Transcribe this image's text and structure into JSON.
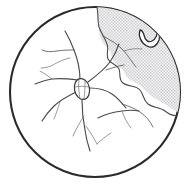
{
  "figure": {
    "title": "Retinal detachment fundus diagram",
    "caption": "",
    "background_color": "#ffffff"
  },
  "globe": {
    "label": "fundus-circle",
    "center_x": 95,
    "center_y": 92,
    "radius": 86,
    "fill_color": "#ffffff",
    "stroke_color": "#2b2b2e",
    "stroke_width": 2.1
  },
  "detachment": {
    "label": "detached-retina-region",
    "description": "Superotemporal bullous detachment",
    "fill_color": "#d6d6d8",
    "pattern": "stipple-dots",
    "pattern_dot_color": "#cfcfd2",
    "pattern_background": "#f2f2f3",
    "edge_color": "#4a4a4f",
    "path": "M 96 6 C 100 26 96 38 106 46 C 114 53 110 62 118 66 C 126 70 124 78 134 82 C 144 86 146 94 156 99 C 166 104 172 110 178 112 C 172 70 150 30 114 11 Z"
  },
  "optic_disc": {
    "label": "optic-disc",
    "center_x": 82,
    "center_y": 89,
    "radius_x": 7.5,
    "radius_y": 10.5,
    "rotation_deg": -12,
    "fill_color": "#ffffff",
    "stroke_color": "#3a3a3e"
  },
  "tear": {
    "label": "horseshoe-retinal-tear",
    "description": "U-shaped flap tear at superotemporal periphery",
    "center_x": 148,
    "center_y": 40,
    "fill_color": "#ffffff",
    "stroke_color": "#2f2f33",
    "path": "M 140 31 C 139 36 141 42 146 45 C 151 48 156 45 158 40 C 159 36 158 33 156 31 C 157 35 156 39 152 41 C 148 43 145 40 144 36 C 143 33 142 31 140 31 Z"
  },
  "vessels": {
    "label": "retinal-vessel-tree",
    "stroke_color": "#4a4a4f",
    "branch_count": 14,
    "paths": [
      "M 80 80 C 80 70 78 60 74 50 C 71 42 68 36 65 31",
      "M 74 50 C 69 50 63 50 57 51 C 51 52 46 52 42 50",
      "M 70 58 C 64 59 58 62 53 65 C 49 67 45 68 41 68",
      "M 78 80 C 70 79 60 78 52 79 C 45 80 40 82 35 84",
      "M 76 92 C 68 96 60 100 54 106 C 49 111 45 116 42 121",
      "M 60 102 C 58 108 56 114 54 119",
      "M 82 100 C 82 110 83 120 85 130 C 86 138 88 145 90 150",
      "M 84 116 C 80 122 76 129 73 135",
      "M 86 126 C 90 132 94 138 98 143",
      "M 88 82 C 96 76 104 70 110 62 C 114 56 117 50 119 44",
      "M 106 70 C 112 68 118 66 124 65",
      "M 90 88 C 98 88 106 90 112 94 C 118 98 122 103 126 108",
      "M 122 104 C 128 106 134 108 140 112 C 146 116 150 121 153 126",
      "M 98 118 C 106 114 114 112 122 111 C 128 110 134 110 139 111"
    ]
  },
  "annotations": {
    "visible_labels": []
  }
}
